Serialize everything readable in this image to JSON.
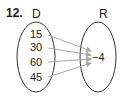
{
  "problem": {
    "number": "12."
  },
  "domain_set": {
    "label": "D",
    "values": [
      "15",
      "30",
      "60",
      "45"
    ]
  },
  "range_set": {
    "label": "R",
    "values": [
      "−4"
    ]
  },
  "mappings": [
    {
      "from": "15",
      "to": "−4"
    },
    {
      "from": "30",
      "to": "−4"
    },
    {
      "from": "60",
      "to": "−4"
    },
    {
      "from": "45",
      "to": "−4"
    }
  ],
  "colors": {
    "text": "#1a1a1a",
    "oval_stroke": "#333333",
    "arrow": "#a8a8a8"
  }
}
